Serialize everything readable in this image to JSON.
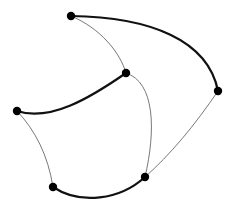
{
  "diagram": {
    "type": "graph",
    "nodes": [
      {
        "id": "A",
        "x": 71,
        "y": 16
      },
      {
        "id": "B",
        "x": 126,
        "y": 73
      },
      {
        "id": "C",
        "x": 17,
        "y": 111
      },
      {
        "id": "D",
        "x": 218,
        "y": 91
      },
      {
        "id": "E",
        "x": 53,
        "y": 187
      },
      {
        "id": "F",
        "x": 145,
        "y": 177
      }
    ],
    "edges": [
      {
        "from": "A",
        "to": "D",
        "weight": "thick"
      },
      {
        "from": "A",
        "to": "B",
        "weight": "thin"
      },
      {
        "from": "B",
        "to": "C",
        "weight": "thick"
      },
      {
        "from": "B",
        "to": "F",
        "weight": "thin"
      },
      {
        "from": "C",
        "to": "E",
        "weight": "thin"
      },
      {
        "from": "E",
        "to": "F",
        "weight": "thick"
      },
      {
        "from": "D",
        "to": "F",
        "weight": "thin"
      }
    ],
    "colors": {
      "node": "#000000",
      "edge_thick": "#111111",
      "edge_thin": "#555555",
      "background": "#ffffff"
    }
  }
}
